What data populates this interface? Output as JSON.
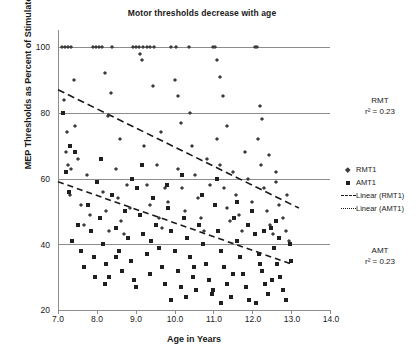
{
  "chart_data": {
    "type": "scatter",
    "title": "Motor thresholds decrease with age",
    "xlabel": "Age in Years",
    "ylabel": "MEP Thresholds as Percent of Stimulator Output",
    "xlim": [
      7.0,
      14.0
    ],
    "ylim": [
      20,
      100
    ],
    "xticks": [
      "7.0",
      "8.0",
      "9.0",
      "10.0",
      "11.0",
      "12.0",
      "13.0",
      "14.0"
    ],
    "yticks": [
      "20",
      "40",
      "60",
      "80",
      "100"
    ],
    "grid": "horizontal",
    "legend_position": "right",
    "legend": [
      "RMT1",
      "AMT1",
      "Linear (RMT1)",
      "Linear (AMT1)"
    ],
    "annotations": [
      {
        "label": "RMT",
        "stat": "r² = 0.23",
        "position": "upper-right"
      },
      {
        "label": "AMT",
        "stat": "r² = 0.23",
        "position": "lower-right"
      }
    ],
    "series": [
      {
        "name": "RMT1",
        "marker": "diamond",
        "color": "#3c3c3c",
        "points": [
          [
            7.1,
            100
          ],
          [
            7.18,
            100
          ],
          [
            7.26,
            100
          ],
          [
            7.34,
            100
          ],
          [
            7.15,
            84
          ],
          [
            7.22,
            74
          ],
          [
            7.2,
            68
          ],
          [
            7.26,
            64
          ],
          [
            7.33,
            63
          ],
          [
            7.3,
            55
          ],
          [
            7.45,
            76
          ],
          [
            7.52,
            66
          ],
          [
            7.6,
            52
          ],
          [
            7.68,
            46
          ],
          [
            7.75,
            61
          ],
          [
            7.82,
            49
          ],
          [
            7.9,
            100
          ],
          [
            7.98,
            100
          ],
          [
            8.05,
            100
          ],
          [
            8.14,
            100
          ],
          [
            8.2,
            92
          ],
          [
            8.28,
            79
          ],
          [
            8.16,
            56
          ],
          [
            8.24,
            50
          ],
          [
            8.32,
            44
          ],
          [
            8.4,
            100
          ],
          [
            8.48,
            63
          ],
          [
            8.55,
            54
          ],
          [
            8.62,
            47
          ],
          [
            8.7,
            43
          ],
          [
            8.78,
            58
          ],
          [
            8.86,
            51
          ],
          [
            8.94,
            100
          ],
          [
            9.02,
            100
          ],
          [
            9.08,
            100
          ],
          [
            9.12,
            98
          ],
          [
            9.16,
            96
          ],
          [
            9.2,
            100
          ],
          [
            9.28,
            100
          ],
          [
            9.36,
            100
          ],
          [
            9.22,
            70
          ],
          [
            9.3,
            58
          ],
          [
            9.38,
            52
          ],
          [
            9.46,
            100
          ],
          [
            9.54,
            64
          ],
          [
            9.6,
            48
          ],
          [
            9.68,
            45
          ],
          [
            9.76,
            57
          ],
          [
            9.84,
            53
          ],
          [
            9.92,
            100
          ],
          [
            10.0,
            90
          ],
          [
            10.08,
            85
          ],
          [
            10.16,
            77
          ],
          [
            10.1,
            63
          ],
          [
            10.2,
            57
          ],
          [
            10.28,
            50
          ],
          [
            10.36,
            100
          ],
          [
            10.44,
            70
          ],
          [
            10.52,
            61
          ],
          [
            10.6,
            54
          ],
          [
            10.68,
            48
          ],
          [
            10.76,
            44
          ],
          [
            10.84,
            66
          ],
          [
            10.92,
            58
          ],
          [
            11.0,
            100
          ],
          [
            11.08,
            96
          ],
          [
            11.16,
            91
          ],
          [
            11.24,
            85
          ],
          [
            11.1,
            72
          ],
          [
            11.18,
            64
          ],
          [
            11.26,
            57
          ],
          [
            11.34,
            51
          ],
          [
            11.42,
            47
          ],
          [
            11.5,
            62
          ],
          [
            11.58,
            55
          ],
          [
            11.66,
            49
          ],
          [
            11.74,
            44
          ],
          [
            11.82,
            68
          ],
          [
            11.9,
            60
          ],
          [
            11.98,
            53
          ],
          [
            12.06,
            100
          ],
          [
            12.14,
            72
          ],
          [
            12.22,
            64
          ],
          [
            12.3,
            57
          ],
          [
            12.38,
            50
          ],
          [
            12.46,
            46
          ],
          [
            12.54,
            43
          ],
          [
            12.62,
            59
          ],
          [
            12.7,
            52
          ],
          [
            12.78,
            48
          ],
          [
            12.86,
            44
          ],
          [
            12.94,
            41
          ],
          [
            12.2,
            82
          ],
          [
            12.26,
            78
          ],
          [
            12.44,
            67
          ],
          [
            12.6,
            62
          ],
          [
            12.9,
            55
          ],
          [
            10.04,
            100
          ],
          [
            11.04,
            100
          ],
          [
            12.12,
            100
          ],
          [
            9.44,
            88
          ],
          [
            8.36,
            86
          ],
          [
            7.4,
            90
          ],
          [
            10.4,
            80
          ],
          [
            11.36,
            76
          ],
          [
            9.64,
            74
          ],
          [
            8.6,
            72
          ]
        ]
      },
      {
        "name": "AMT1",
        "marker": "square",
        "color": "#202020",
        "points": [
          [
            7.12,
            80
          ],
          [
            7.2,
            62
          ],
          [
            7.28,
            56
          ],
          [
            7.36,
            41
          ],
          [
            7.44,
            68
          ],
          [
            7.52,
            46
          ],
          [
            7.6,
            38
          ],
          [
            7.68,
            33
          ],
          [
            7.76,
            52
          ],
          [
            7.84,
            44
          ],
          [
            7.92,
            36
          ],
          [
            8.0,
            59
          ],
          [
            8.08,
            48
          ],
          [
            8.16,
            40
          ],
          [
            8.24,
            34
          ],
          [
            8.32,
            30
          ],
          [
            8.4,
            55
          ],
          [
            8.48,
            45
          ],
          [
            8.56,
            38
          ],
          [
            8.64,
            32
          ],
          [
            8.72,
            50
          ],
          [
            8.8,
            42
          ],
          [
            8.88,
            35
          ],
          [
            8.96,
            29
          ],
          [
            9.04,
            57
          ],
          [
            9.12,
            49
          ],
          [
            9.2,
            43
          ],
          [
            9.28,
            37
          ],
          [
            9.36,
            31
          ],
          [
            9.44,
            54
          ],
          [
            9.52,
            46
          ],
          [
            9.6,
            39
          ],
          [
            9.68,
            33
          ],
          [
            9.76,
            28
          ],
          [
            9.84,
            51
          ],
          [
            9.92,
            44
          ],
          [
            10.0,
            38
          ],
          [
            10.08,
            32
          ],
          [
            10.16,
            27
          ],
          [
            10.24,
            48
          ],
          [
            10.32,
            42
          ],
          [
            10.4,
            36
          ],
          [
            10.48,
            30
          ],
          [
            10.56,
            26
          ],
          [
            10.64,
            46
          ],
          [
            10.72,
            40
          ],
          [
            10.8,
            34
          ],
          [
            10.88,
            29
          ],
          [
            10.96,
            25
          ],
          [
            11.04,
            52
          ],
          [
            11.12,
            44
          ],
          [
            11.2,
            38
          ],
          [
            11.28,
            33
          ],
          [
            11.36,
            28
          ],
          [
            11.44,
            24
          ],
          [
            11.52,
            48
          ],
          [
            11.6,
            41
          ],
          [
            11.68,
            36
          ],
          [
            11.76,
            31
          ],
          [
            11.84,
            27
          ],
          [
            11.92,
            23
          ],
          [
            12.0,
            50
          ],
          [
            12.08,
            43
          ],
          [
            12.16,
            37
          ],
          [
            12.24,
            32
          ],
          [
            12.32,
            28
          ],
          [
            12.4,
            25
          ],
          [
            12.48,
            45
          ],
          [
            12.56,
            39
          ],
          [
            12.64,
            34
          ],
          [
            12.72,
            30
          ],
          [
            12.8,
            26
          ],
          [
            12.88,
            23
          ],
          [
            12.96,
            40
          ],
          [
            13.0,
            35
          ],
          [
            12.6,
            47
          ],
          [
            12.3,
            44
          ],
          [
            11.1,
            60
          ],
          [
            10.2,
            61
          ],
          [
            9.15,
            64
          ],
          [
            8.1,
            66
          ],
          [
            7.3,
            70
          ],
          [
            11.6,
            53
          ],
          [
            10.7,
            55
          ],
          [
            9.8,
            58
          ],
          [
            8.9,
            60
          ],
          [
            12.7,
            42
          ],
          [
            11.9,
            46
          ],
          [
            9.4,
            41
          ],
          [
            8.5,
            36
          ],
          [
            10.5,
            33
          ],
          [
            11.5,
            31
          ],
          [
            12.2,
            34
          ],
          [
            7.95,
            30
          ],
          [
            9.0,
            27
          ],
          [
            10.3,
            24
          ],
          [
            11.2,
            22
          ],
          [
            12.1,
            22
          ],
          [
            8.2,
            28
          ],
          [
            9.9,
            23
          ],
          [
            11.0,
            26
          ],
          [
            12.5,
            29
          ]
        ]
      }
    ],
    "trendlines": [
      {
        "name": "Linear (RMT1)",
        "x0": 7.0,
        "y0": 87,
        "x1": 13.2,
        "y1": 51,
        "style": "dashed"
      },
      {
        "name": "Linear (AMT1)",
        "x0": 7.0,
        "y0": 59,
        "x1": 13.0,
        "y1": 34,
        "style": "dashed"
      }
    ]
  }
}
